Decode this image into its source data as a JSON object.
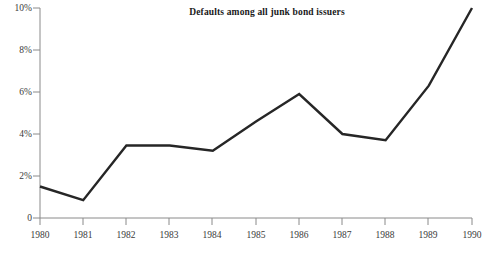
{
  "chart_data": {
    "type": "line",
    "title": "Defaults among all junk bond issuers",
    "xlabel": "",
    "ylabel": "",
    "x": [
      1980,
      1981,
      1982,
      1983,
      1984,
      1985,
      1986,
      1987,
      1988,
      1989,
      1990
    ],
    "categories": [
      "1980",
      "1981",
      "1982",
      "1983",
      "1984",
      "1985",
      "1986",
      "1987",
      "1988",
      "1989",
      "1990"
    ],
    "values": [
      1.5,
      0.85,
      3.45,
      3.45,
      3.2,
      4.6,
      5.9,
      4.0,
      3.7,
      6.3,
      10.0
    ],
    "series": [
      {
        "name": "Defaults among all junk bond issuers",
        "values": [
          1.5,
          0.85,
          3.45,
          3.45,
          3.2,
          4.6,
          5.9,
          4.0,
          3.7,
          6.3,
          10.0
        ]
      }
    ],
    "ylim": [
      0,
      10
    ],
    "xlim": [
      1980,
      1990
    ],
    "ytick_values": [
      0,
      2,
      4,
      6,
      8,
      10
    ],
    "ytick_labels": [
      "0",
      "2%",
      "4%",
      "6%",
      "8%",
      "10%"
    ],
    "xtick_labels": [
      "1980",
      "1981",
      "1982",
      "1983",
      "1984",
      "1985",
      "1986",
      "1987",
      "1988",
      "1989",
      "1990"
    ],
    "grid": false,
    "legend": null,
    "line_color": "#262626",
    "axis_color": "#808080",
    "background_color": "#ffffff"
  }
}
